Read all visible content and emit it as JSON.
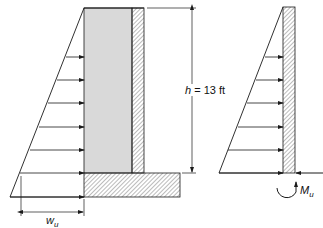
{
  "diagram": {
    "left_figure": {
      "description": "Cantilever retaining wall with triangular lateral soil pressure",
      "height_label_var": "h",
      "height_label_eq": " = 13 ft",
      "load_label_var": "w",
      "load_label_sub": "u"
    },
    "right_figure": {
      "description": "Wall stem free body with triangular load, base shear and moment",
      "moment_label_var": "M",
      "moment_label_sub": "u"
    },
    "colors": {
      "line": "#1a1a1a",
      "stem_fill": "#d9d9d9",
      "hatch": "#555555"
    }
  }
}
